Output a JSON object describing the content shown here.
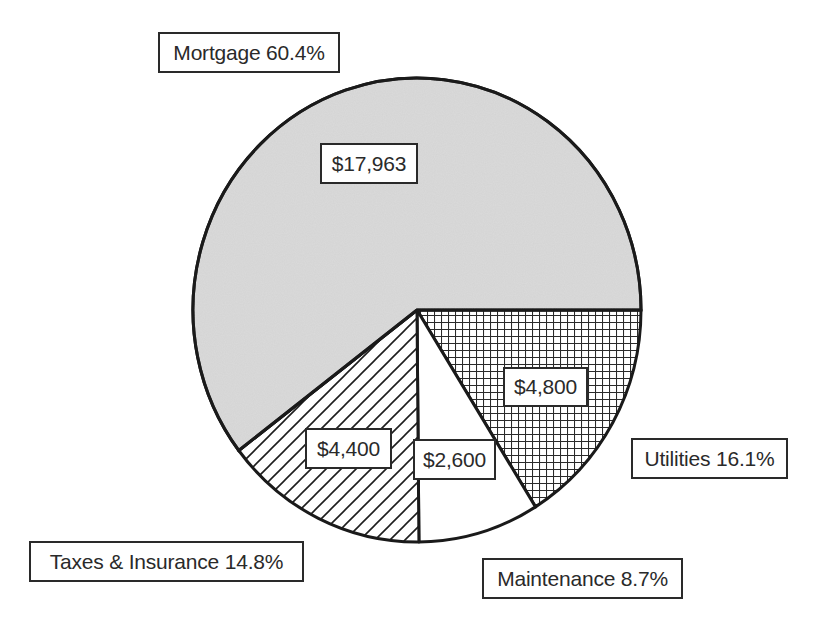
{
  "chart_data": {
    "type": "pie",
    "title": "",
    "start_angle_deg": 0,
    "direction": "clockwise",
    "slices": [
      {
        "name": "Utilities",
        "value": 4800,
        "value_label": "$4,800",
        "percent": 16.1,
        "category_label": "Utilities 16.1%",
        "pattern": "grid"
      },
      {
        "name": "Maintenance",
        "value": 2600,
        "value_label": "$2,600",
        "percent": 8.7,
        "category_label": "Maintenance 8.7%",
        "pattern": "solid-white"
      },
      {
        "name": "Taxes & Insurance",
        "value": 4400,
        "value_label": "$4,400",
        "percent": 14.8,
        "category_label": "Taxes & Insurance 14.8%",
        "pattern": "diagonal-hatch"
      },
      {
        "name": "Mortgage",
        "value": 17963,
        "value_label": "$17,963",
        "percent": 60.4,
        "category_label": "Mortgage 60.4%",
        "pattern": "gray-speckle"
      }
    ],
    "total": 29763,
    "legend": "none (data labels with category name and percent outside)",
    "colors": {
      "mortgage_fill": "#d3d3d3",
      "outline": "#1a1a1a",
      "text": "#2a2a2a",
      "background": "#ffffff"
    }
  },
  "labels": {
    "mortgage_category": "Mortgage 60.4%",
    "mortgage_value": "$17,963",
    "utilities_category": "Utilities 16.1%",
    "utilities_value": "$4,800",
    "maintenance_category": "Maintenance 8.7%",
    "maintenance_value": "$2,600",
    "taxes_category": "Taxes & Insurance 14.8%",
    "taxes_value": "$4,400"
  }
}
